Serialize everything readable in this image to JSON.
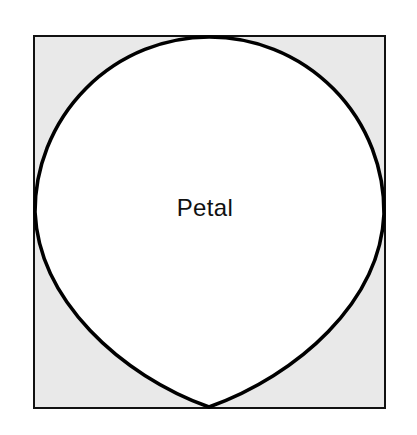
{
  "figure": {
    "name": "petal-geometry-figure",
    "background_color": "#ffffff",
    "label": "Petal",
    "label_color": "#111111",
    "label_font_size": 24,
    "label_x": 205,
    "label_y": 216,
    "square": {
      "name": "bounding-square",
      "x": 34,
      "y": 36,
      "width": 351,
      "height": 372,
      "fill_color": "#e9e9e9",
      "stroke_color": "#111111",
      "stroke_width": 2.2
    },
    "petal": {
      "name": "petal-shape",
      "fill_color": "#ffffff",
      "stroke_color": "#000000",
      "stroke_width": 3.6,
      "top_point_x": 209,
      "top_point_y": 37,
      "left_point_x": 35,
      "left_point_y": 212,
      "right_point_x": 384,
      "right_point_y": 214,
      "bottom_point_x": 209,
      "bottom_point_y": 407,
      "description": "Large circular arc across the top touching the square on the left, top and right; two lower arcs converging to a cusp at the bottom-centre of the square."
    }
  }
}
